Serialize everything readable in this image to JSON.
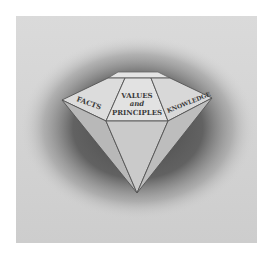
{
  "figure": {
    "labels": {
      "left_facet": "FACTS",
      "center_facet_line1": "VALUES",
      "center_facet_line2": "and",
      "center_facet_line3": "PRINCIPLES",
      "right_facet": "KNOWLEDGE"
    },
    "colors": {
      "background": "#d2d2d2",
      "shadow": "#5a5a5a",
      "facet_light": "#dcdcdc",
      "facet_mid": "#c8c8c8",
      "facet_dark": "#b4b4b4",
      "line": "#555555"
    }
  }
}
